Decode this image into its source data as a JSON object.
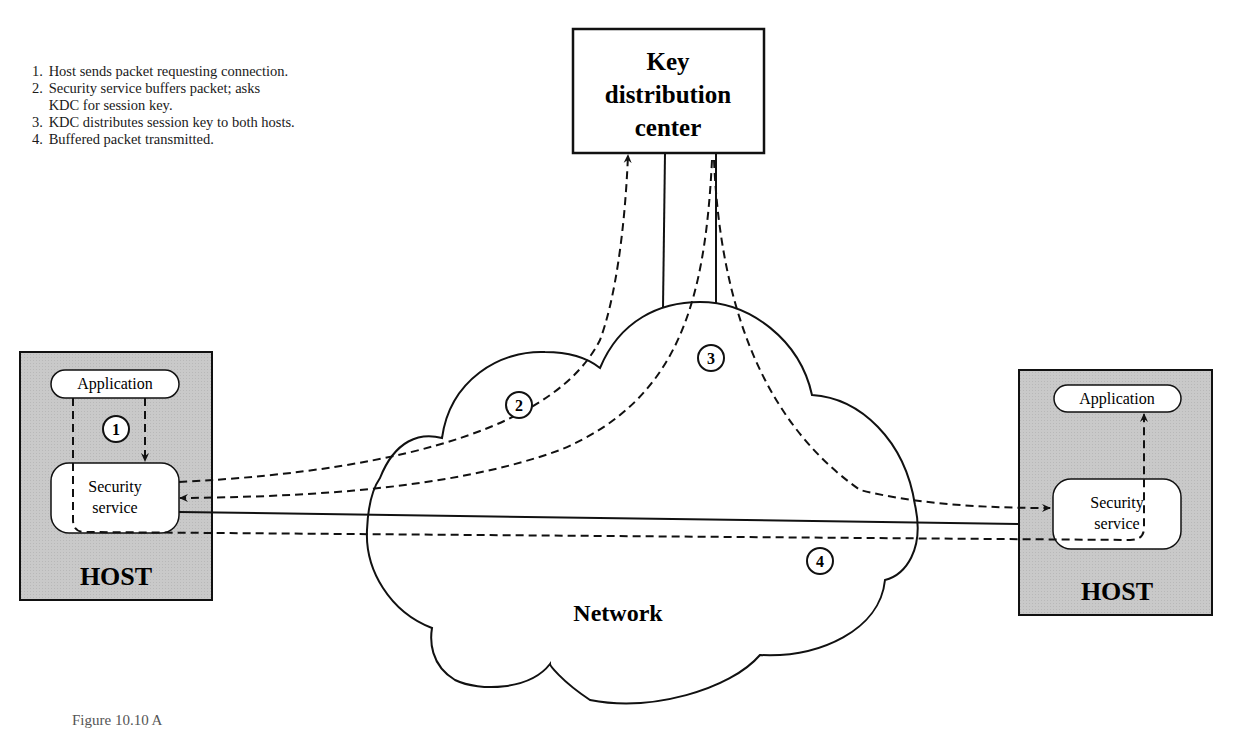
{
  "figure": {
    "caption_visible": "Figure 10.10  A",
    "steps": [
      {
        "num": "1.",
        "lines": [
          "Host sends packet requesting connection."
        ]
      },
      {
        "num": "2.",
        "lines": [
          "Security service buffers packet; asks",
          "KDC for session key."
        ]
      },
      {
        "num": "3.",
        "lines": [
          "KDC distributes session key to both hosts."
        ]
      },
      {
        "num": "4.",
        "lines": [
          "Buffered packet transmitted."
        ]
      }
    ]
  },
  "kdc": {
    "line1": "Key",
    "line2": "distribution",
    "line3": "center"
  },
  "network": {
    "label": "Network"
  },
  "left_host": {
    "label": "HOST",
    "application": "Application",
    "security_line1": "Security",
    "security_line2": "service"
  },
  "right_host": {
    "label": "HOST",
    "application": "Application",
    "security_line1": "Security",
    "security_line2": "service"
  },
  "markers": {
    "m1": "1",
    "m2": "2",
    "m3": "3",
    "m4": "4"
  },
  "colors": {
    "host_fill": "#c8c8c8",
    "line": "#111111",
    "background": "#ffffff"
  }
}
